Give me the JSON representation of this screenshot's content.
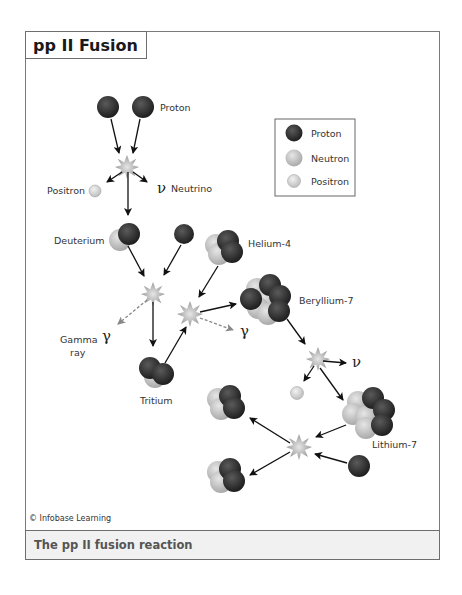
{
  "title": "pp II Fusion",
  "caption": "The pp II fusion reaction",
  "credit": "© Infobase Learning",
  "legend": {
    "items": [
      {
        "label": "Proton",
        "color": "#2b2b2b"
      },
      {
        "label": "Neutron",
        "color": "#bdbdbd"
      },
      {
        "label": "Positron",
        "color": "#d6d6d6"
      }
    ]
  },
  "labels": {
    "proton": "Proton",
    "positron": "Positron",
    "neutrino_symbol": "ν",
    "neutrino": "Neutrino",
    "deuterium": "Deuterium",
    "helium4": "Helium-4",
    "beryllium7": "Beryllium-7",
    "gamma_symbol": "γ",
    "gamma_ray_1": "Gamma",
    "gamma_ray_2": "ray",
    "tritium": "Tritium",
    "lithium7": "Lithium-7"
  },
  "colors": {
    "proton": "#2b2b2b",
    "neutron": "#bdbdbd",
    "positron": "#d6d6d6",
    "arrow": "#111111",
    "gamma_arrow": "#888888",
    "star": "#b8b8b8",
    "caption_bg": "#f1f1f1"
  }
}
